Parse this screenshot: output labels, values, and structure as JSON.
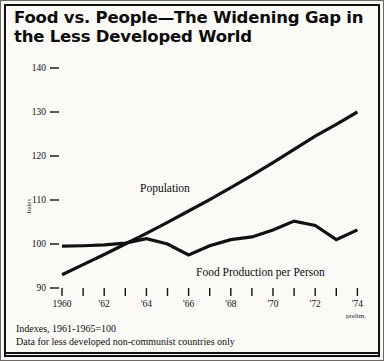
{
  "title": "Food vs. People—The Widening Gap in the Less Developed World",
  "footnotes": {
    "line1": "Indexes, 1961-1965=100",
    "line2": "Data for less developed non-communist countries only"
  },
  "notes": {
    "prelim": "prelim."
  },
  "labels": {
    "population": "Population",
    "food": "Food Production per Person"
  },
  "chart_data": {
    "type": "line",
    "title": "Food vs. People—The Widening Gap in the Less Developed World",
    "xlabel": "",
    "ylabel": "Index",
    "xlim": [
      1960,
      1974
    ],
    "ylim": [
      90,
      140
    ],
    "yticks": [
      90,
      100,
      110,
      120,
      130,
      140
    ],
    "xticks": [
      1960,
      1961,
      1962,
      1963,
      1964,
      1965,
      1966,
      1967,
      1968,
      1969,
      1970,
      1971,
      1972,
      1973,
      1974
    ],
    "xticklabels": [
      "1960",
      "",
      "'62",
      "",
      "'64",
      "",
      "'66",
      "",
      "'68",
      "",
      "'70",
      "",
      "'72",
      "",
      "'74"
    ],
    "grid": false,
    "legend": "inline-annotations",
    "x": [
      1960,
      1961,
      1962,
      1963,
      1964,
      1965,
      1966,
      1967,
      1968,
      1969,
      1970,
      1971,
      1972,
      1973,
      1974
    ],
    "series": [
      {
        "name": "Population",
        "values": [
          93.0,
          95.3,
          97.6,
          100.0,
          102.4,
          104.9,
          107.5,
          110.1,
          112.8,
          115.6,
          118.5,
          121.5,
          124.5,
          127.2,
          130.0
        ]
      },
      {
        "name": "Food Production per Person",
        "values": [
          99.5,
          99.6,
          99.8,
          100.2,
          101.2,
          100.0,
          97.5,
          99.6,
          101.0,
          101.6,
          103.2,
          105.2,
          104.2,
          101.0,
          103.2
        ]
      }
    ],
    "series_annotations": [
      {
        "series": "Population",
        "text": "Population"
      },
      {
        "series": "Food Production per Person",
        "text": "Food Production per Person"
      }
    ],
    "annotations": [
      {
        "text": "prelim.",
        "at_x": 1974
      },
      {
        "text": "Indexes, 1961-1965=100"
      },
      {
        "text": "Data for less developed non-communist countries only"
      }
    ]
  }
}
